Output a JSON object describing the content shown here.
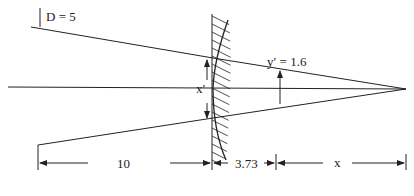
{
  "diagram": {
    "type": "optics ray diagram (refracting spherical surface)",
    "labels": {
      "aperture": "D = 5",
      "image_height": "y′ = 1.6",
      "surface_height": "x′",
      "object_distance": "10",
      "surface_gap": "3.73",
      "image_distance": "x"
    },
    "colors": {
      "ink": "#222222",
      "background": "#ffffff"
    }
  }
}
